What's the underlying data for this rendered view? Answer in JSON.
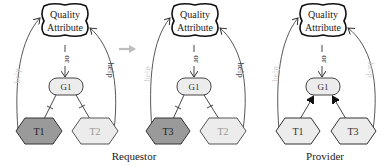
{
  "colors": {
    "stroke": "#333333",
    "help_faded": "#cfcfcf",
    "task_dark": "#9a9a9a",
    "task_light": "#ececec",
    "goal_fill": "#ececec",
    "arrow_grey": "#bdbdbd",
    "faded_task_text": "#9a9a9a"
  },
  "diagrams": [
    {
      "softgoal": {
        "line1": "Quality",
        "line2": "Attribute"
      },
      "goal": "G1",
      "or_label": "or",
      "left_help": "help",
      "right_help": "help",
      "left_task": "T1",
      "right_task": "T2"
    },
    {
      "softgoal": {
        "line1": "Quality",
        "line2": "Attribute"
      },
      "goal": "G1",
      "or_label": "or",
      "left_help": "help",
      "right_help": "help",
      "left_task": "T3",
      "right_task": "T2"
    },
    {
      "softgoal": {
        "line1": "Quality",
        "line2": "Attribute"
      },
      "goal": "G1",
      "or_label": "or",
      "left_help": "help",
      "right_help": "help",
      "left_task": "T1",
      "right_task": "T3"
    }
  ],
  "captions": {
    "requestor": "Requestor",
    "provider": "Provider"
  }
}
